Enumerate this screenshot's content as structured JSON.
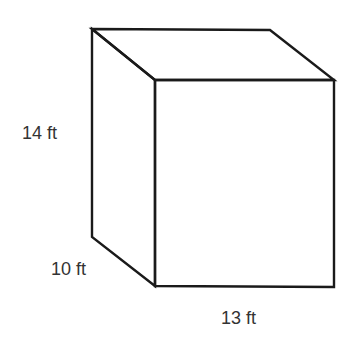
{
  "figure": {
    "shape": "rectangular prism",
    "labels": {
      "height": "14 ft",
      "depth": "10 ft",
      "width": "13 ft"
    },
    "colors": {
      "stroke": "#1a1a1a",
      "text": "#333333",
      "background": "#ffffff"
    }
  }
}
